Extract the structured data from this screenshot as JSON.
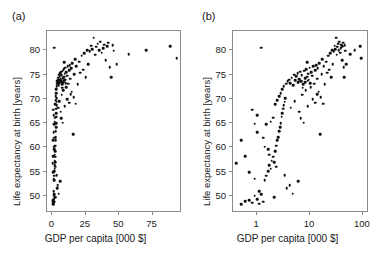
{
  "figure": {
    "panel_a_tag": "(a)",
    "panel_b_tag": "(b)"
  },
  "chart_data": [
    {
      "type": "scatter",
      "panel": "(a)",
      "title": "",
      "xlabel": "GDP per capita [000 $]",
      "ylabel": "Life expectancy at birth [years]",
      "xscale": "linear",
      "yscale": "linear",
      "xlim": [
        -4,
        97
      ],
      "ylim": [
        46.5,
        84
      ],
      "xticks": [
        0,
        25,
        50,
        75
      ],
      "yticks": [
        50,
        55,
        60,
        65,
        70,
        75,
        80
      ],
      "grid": false,
      "legend": "none",
      "marker": "filled-circle",
      "marker_color": "#111111",
      "points": [
        [
          0.5,
          48.3
        ],
        [
          0.6,
          48.9
        ],
        [
          0.7,
          49.1
        ],
        [
          0.8,
          48.6
        ],
        [
          0.9,
          50.1
        ],
        [
          1.0,
          49.4
        ],
        [
          1.1,
          51.0
        ],
        [
          1.2,
          50.4
        ],
        [
          1.3,
          48.8
        ],
        [
          1.4,
          53.2
        ],
        [
          1.5,
          54.2
        ],
        [
          1.6,
          55.1
        ],
        [
          1.7,
          56.4
        ],
        [
          1.8,
          55.6
        ],
        [
          1.9,
          57.3
        ],
        [
          2.0,
          58.1
        ],
        [
          2.1,
          57.0
        ],
        [
          2.2,
          59.2
        ],
        [
          2.3,
          60.4
        ],
        [
          2.4,
          61.5
        ],
        [
          2.5,
          62.1
        ],
        [
          2.6,
          63.4
        ],
        [
          2.7,
          64.2
        ],
        [
          2.8,
          65.0
        ],
        [
          2.9,
          66.3
        ],
        [
          3.0,
          67.1
        ],
        [
          3.1,
          68.0
        ],
        [
          3.2,
          68.7
        ],
        [
          3.3,
          69.4
        ],
        [
          3.4,
          70.1
        ],
        [
          0.4,
          56.8
        ],
        [
          0.5,
          61.5
        ],
        [
          0.6,
          58.2
        ],
        [
          0.7,
          54.9
        ],
        [
          0.9,
          53.6
        ],
        [
          1.0,
          66.7
        ],
        [
          1.2,
          80.6
        ],
        [
          1.3,
          62.0
        ],
        [
          1.5,
          64.8
        ],
        [
          1.6,
          59.6
        ],
        [
          1.8,
          65.3
        ],
        [
          2.0,
          66.1
        ],
        [
          2.2,
          68.9
        ],
        [
          2.4,
          69.8
        ],
        [
          2.6,
          70.6
        ],
        [
          2.8,
          71.2
        ],
        [
          3.0,
          72.0
        ],
        [
          3.2,
          72.6
        ],
        [
          3.5,
          73.1
        ],
        [
          3.8,
          73.6
        ],
        [
          4.0,
          74.0
        ],
        [
          4.2,
          73.2
        ],
        [
          4.5,
          74.4
        ],
        [
          4.8,
          72.8
        ],
        [
          5.0,
          75.0
        ],
        [
          5.2,
          73.9
        ],
        [
          5.5,
          74.7
        ],
        [
          5.8,
          75.3
        ],
        [
          6.0,
          73.4
        ],
        [
          6.2,
          74.1
        ],
        [
          6.5,
          75.6
        ],
        [
          6.8,
          73.7
        ],
        [
          7.0,
          74.9
        ],
        [
          7.2,
          72.3
        ],
        [
          7.5,
          73.0
        ],
        [
          7.8,
          75.8
        ],
        [
          8.0,
          74.3
        ],
        [
          8.2,
          73.5
        ],
        [
          8.5,
          76.1
        ],
        [
          8.8,
          74.6
        ],
        [
          9.0,
          73.8
        ],
        [
          9.2,
          75.2
        ],
        [
          9.5,
          74.0
        ],
        [
          9.8,
          76.4
        ],
        [
          10.0,
          73.3
        ],
        [
          10.5,
          75.5
        ],
        [
          11.0,
          74.8
        ],
        [
          11.5,
          76.7
        ],
        [
          12.0,
          73.1
        ],
        [
          12.5,
          75.9
        ],
        [
          13.0,
          77.0
        ],
        [
          13.5,
          74.2
        ],
        [
          14.0,
          76.3
        ],
        [
          14.5,
          71.5
        ],
        [
          15.0,
          77.4
        ],
        [
          15.5,
          62.7
        ],
        [
          16.0,
          70.4
        ],
        [
          16.5,
          75.1
        ],
        [
          17.0,
          78.2
        ],
        [
          17.5,
          69.0
        ],
        [
          18.0,
          76.8
        ],
        [
          19.0,
          73.0
        ],
        [
          20.0,
          77.7
        ],
        [
          21.0,
          75.4
        ],
        [
          22.0,
          78.9
        ],
        [
          23.0,
          76.0
        ],
        [
          24.0,
          79.4
        ],
        [
          25.0,
          74.5
        ],
        [
          26.0,
          80.1
        ],
        [
          27.0,
          77.2
        ],
        [
          28.0,
          79.8
        ],
        [
          29.0,
          81.0
        ],
        [
          30.0,
          80.3
        ],
        [
          31.0,
          82.6
        ],
        [
          32.0,
          79.1
        ],
        [
          33.0,
          80.8
        ],
        [
          34.0,
          81.4
        ],
        [
          35.0,
          80.0
        ],
        [
          36.0,
          81.8
        ],
        [
          37.0,
          79.5
        ],
        [
          38.0,
          80.5
        ],
        [
          39.0,
          81.2
        ],
        [
          40.0,
          78.0
        ],
        [
          41.0,
          80.9
        ],
        [
          42.0,
          81.6
        ],
        [
          43.0,
          76.5
        ],
        [
          44.0,
          74.5
        ],
        [
          45.0,
          81.1
        ],
        [
          46.0,
          79.9
        ],
        [
          48.0,
          77.1
        ],
        [
          4.3,
          68.2
        ],
        [
          5.1,
          69.5
        ],
        [
          6.3,
          67.4
        ],
        [
          7.1,
          70.9
        ],
        [
          8.3,
          71.8
        ],
        [
          9.1,
          68.5
        ],
        [
          10.2,
          72.4
        ],
        [
          11.3,
          70.0
        ],
        [
          12.4,
          69.2
        ],
        [
          13.6,
          71.0
        ],
        [
          3.6,
          51.6
        ],
        [
          4.7,
          50.5
        ],
        [
          5.9,
          53.0
        ],
        [
          2.1,
          49.7
        ],
        [
          1.1,
          48.4
        ],
        [
          70.0,
          80.0
        ],
        [
          88.0,
          80.9
        ],
        [
          93.0,
          78.4
        ],
        [
          57.0,
          79.2
        ],
        [
          0.8,
          67.8
        ],
        [
          0.9,
          64.9
        ],
        [
          1.0,
          63.1
        ],
        [
          1.4,
          60.2
        ],
        [
          1.7,
          58.5
        ],
        [
          2.3,
          56.0
        ],
        [
          3.3,
          54.3
        ],
        [
          4.1,
          52.2
        ],
        [
          6.6,
          66.0
        ],
        [
          7.6,
          65.1
        ],
        [
          8.9,
          77.6
        ]
      ]
    },
    {
      "type": "scatter",
      "panel": "(b)",
      "title": "",
      "xlabel": "GDP per capita [000 $]",
      "ylabel": "Life expectancy at birth [years]",
      "xscale": "log",
      "yscale": "linear",
      "xlim": [
        0.35,
        130
      ],
      "ylim": [
        46.5,
        84
      ],
      "xticks": [
        1,
        10,
        100
      ],
      "yticks": [
        50,
        55,
        60,
        65,
        70,
        75,
        80
      ],
      "grid": false,
      "legend": "none",
      "marker": "filled-circle",
      "marker_color": "#111111",
      "points": [
        [
          0.5,
          48.3
        ],
        [
          0.6,
          48.9
        ],
        [
          0.7,
          49.1
        ],
        [
          0.8,
          48.6
        ],
        [
          0.9,
          50.1
        ],
        [
          1.0,
          49.4
        ],
        [
          1.1,
          51.0
        ],
        [
          1.2,
          50.4
        ],
        [
          1.3,
          48.8
        ],
        [
          1.4,
          53.2
        ],
        [
          1.5,
          54.2
        ],
        [
          1.6,
          55.1
        ],
        [
          1.7,
          56.4
        ],
        [
          1.8,
          55.6
        ],
        [
          1.9,
          57.3
        ],
        [
          2.0,
          58.1
        ],
        [
          2.1,
          57.0
        ],
        [
          2.2,
          59.2
        ],
        [
          2.3,
          60.4
        ],
        [
          2.4,
          61.5
        ],
        [
          2.5,
          62.1
        ],
        [
          2.6,
          63.4
        ],
        [
          2.7,
          64.2
        ],
        [
          2.8,
          65.0
        ],
        [
          2.9,
          66.3
        ],
        [
          3.0,
          67.1
        ],
        [
          3.1,
          68.0
        ],
        [
          3.2,
          68.7
        ],
        [
          3.3,
          69.4
        ],
        [
          3.4,
          70.1
        ],
        [
          0.4,
          56.8
        ],
        [
          0.5,
          61.5
        ],
        [
          0.6,
          58.2
        ],
        [
          0.7,
          54.9
        ],
        [
          0.9,
          53.6
        ],
        [
          1.0,
          66.7
        ],
        [
          1.2,
          80.6
        ],
        [
          1.3,
          62.0
        ],
        [
          1.5,
          64.8
        ],
        [
          1.6,
          59.6
        ],
        [
          1.8,
          65.3
        ],
        [
          2.0,
          66.1
        ],
        [
          2.2,
          68.9
        ],
        [
          2.4,
          69.8
        ],
        [
          2.6,
          70.6
        ],
        [
          2.8,
          71.2
        ],
        [
          3.0,
          72.0
        ],
        [
          3.2,
          72.6
        ],
        [
          3.5,
          73.1
        ],
        [
          3.8,
          73.6
        ],
        [
          4.0,
          74.0
        ],
        [
          4.2,
          73.2
        ],
        [
          4.5,
          74.4
        ],
        [
          4.8,
          72.8
        ],
        [
          5.0,
          75.0
        ],
        [
          5.2,
          73.9
        ],
        [
          5.5,
          74.7
        ],
        [
          5.8,
          75.3
        ],
        [
          6.0,
          73.4
        ],
        [
          6.2,
          74.1
        ],
        [
          6.5,
          75.6
        ],
        [
          6.8,
          73.7
        ],
        [
          7.0,
          74.9
        ],
        [
          7.2,
          72.3
        ],
        [
          7.5,
          73.0
        ],
        [
          7.8,
          75.8
        ],
        [
          8.0,
          74.3
        ],
        [
          8.2,
          73.5
        ],
        [
          8.5,
          76.1
        ],
        [
          8.8,
          74.6
        ],
        [
          9.0,
          73.8
        ],
        [
          9.2,
          75.2
        ],
        [
          9.5,
          74.0
        ],
        [
          9.8,
          76.4
        ],
        [
          10.0,
          73.3
        ],
        [
          10.5,
          75.5
        ],
        [
          11.0,
          74.8
        ],
        [
          11.5,
          76.7
        ],
        [
          12.0,
          73.1
        ],
        [
          12.5,
          75.9
        ],
        [
          13.0,
          77.0
        ],
        [
          13.5,
          74.2
        ],
        [
          14.0,
          76.3
        ],
        [
          14.5,
          71.5
        ],
        [
          15.0,
          77.4
        ],
        [
          15.5,
          62.7
        ],
        [
          16.0,
          70.4
        ],
        [
          16.5,
          75.1
        ],
        [
          17.0,
          78.2
        ],
        [
          17.5,
          69.0
        ],
        [
          18.0,
          76.8
        ],
        [
          19.0,
          73.0
        ],
        [
          20.0,
          77.7
        ],
        [
          21.0,
          75.4
        ],
        [
          22.0,
          78.9
        ],
        [
          23.0,
          76.0
        ],
        [
          24.0,
          79.4
        ],
        [
          25.0,
          74.5
        ],
        [
          26.0,
          80.1
        ],
        [
          27.0,
          77.2
        ],
        [
          28.0,
          79.8
        ],
        [
          29.0,
          81.0
        ],
        [
          30.0,
          80.3
        ],
        [
          31.0,
          82.6
        ],
        [
          32.0,
          79.1
        ],
        [
          33.0,
          80.8
        ],
        [
          34.0,
          81.4
        ],
        [
          35.0,
          80.0
        ],
        [
          36.0,
          81.8
        ],
        [
          37.0,
          79.5
        ],
        [
          38.0,
          80.5
        ],
        [
          39.0,
          81.2
        ],
        [
          40.0,
          78.0
        ],
        [
          41.0,
          80.9
        ],
        [
          42.0,
          81.6
        ],
        [
          43.0,
          76.5
        ],
        [
          44.0,
          74.5
        ],
        [
          45.0,
          81.1
        ],
        [
          46.0,
          79.9
        ],
        [
          48.0,
          77.1
        ],
        [
          4.3,
          68.2
        ],
        [
          5.1,
          69.5
        ],
        [
          6.3,
          67.4
        ],
        [
          7.1,
          70.9
        ],
        [
          8.3,
          71.8
        ],
        [
          9.1,
          68.5
        ],
        [
          10.2,
          72.4
        ],
        [
          11.3,
          70.0
        ],
        [
          12.4,
          69.2
        ],
        [
          13.6,
          71.0
        ],
        [
          3.6,
          51.6
        ],
        [
          4.7,
          50.5
        ],
        [
          5.9,
          53.0
        ],
        [
          2.1,
          49.7
        ],
        [
          1.1,
          48.4
        ],
        [
          70.0,
          80.0
        ],
        [
          88.0,
          80.9
        ],
        [
          93.0,
          78.4
        ],
        [
          57.0,
          79.2
        ],
        [
          0.8,
          67.8
        ],
        [
          0.9,
          64.9
        ],
        [
          1.0,
          63.1
        ],
        [
          1.4,
          60.2
        ],
        [
          1.7,
          58.5
        ],
        [
          2.3,
          56.0
        ],
        [
          3.3,
          54.3
        ],
        [
          4.1,
          52.2
        ],
        [
          6.6,
          66.0
        ],
        [
          7.6,
          65.1
        ],
        [
          8.9,
          77.6
        ]
      ]
    }
  ]
}
